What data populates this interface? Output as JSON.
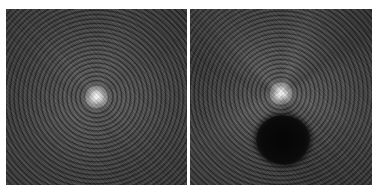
{
  "figure": {
    "panels": [
      {
        "id": "left",
        "label": "",
        "center": {
          "x_pct": "50%",
          "y_pct": "50%"
        },
        "features": [
          "bright central spot",
          "concentric rings",
          "uniform background"
        ]
      },
      {
        "id": "right",
        "label": "",
        "center": {
          "x_pct": "50%",
          "y_pct": "48%"
        },
        "features": [
          "bright central spot",
          "concentric rings",
          "radial streaks",
          "dark circular occlusion below center"
        ],
        "occlusion": {
          "left_px": 65,
          "top_px": 105,
          "width_px": 56,
          "height_px": 52,
          "color": "#0a0a0a"
        }
      }
    ],
    "colors": {
      "background": "#ffffff",
      "ring_light": "#6a6a6a",
      "ring_dark": "#333333",
      "center_spot": "#ffffff"
    }
  }
}
